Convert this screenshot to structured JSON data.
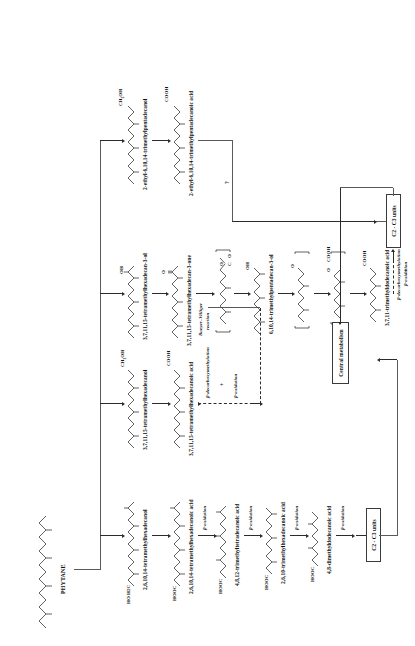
{
  "figure": {
    "title": "PHYTANE",
    "type": "biochemical-degradation-pathway"
  },
  "nodes": {
    "phytane": {
      "name": "PHYTANE"
    },
    "branch_mono_terminal": {
      "col_header_left": "HO H2C",
      "compounds": [
        {
          "atom": "HO H2C",
          "name": "2,6,10,14-tetramethylhexadecanol"
        },
        {
          "atom": "HOOC",
          "name": "2,6,10,14-tetramethylhexadecanoic acid"
        },
        {
          "atom": "HOOC",
          "name": "4,8,12-trimethyltetradecanoic acid"
        },
        {
          "atom": "HOOC",
          "name": "2,6,10-trimethylhexadecanoic acid"
        },
        {
          "atom": "HOOC",
          "name": "4,8-dimethyldodecanoic acid"
        }
      ],
      "step_labels": [
        "β-oxidation",
        "β-oxidation",
        "β-oxidation",
        "β-oxidation"
      ]
    },
    "branch_omega": {
      "compounds": [
        {
          "atom": "CH2OH",
          "name": "3,7,11,15-tetramethylhexadecanol"
        },
        {
          "atom": "COOH",
          "name": "3,7,11,15-tetramethylhexadecanoic acid"
        }
      ],
      "step_label_1": "β-decarboxymethylation",
      "step_plus": "+",
      "step_label_2": "β-oxidation"
    },
    "branch_subterminal": {
      "compounds": [
        {
          "atom": "OH",
          "name": "3,7,11,15-tetramethylhexadecan-3-ol"
        },
        {
          "atom": "O",
          "name": "3,7,11,15-tetramethylhexadecan-3-one"
        },
        {
          "atom": "O C O",
          "name": ""
        },
        {
          "atom": "OH",
          "name": "6,10,14-trimethylpentadecan-3-ol"
        },
        {
          "atom": "O",
          "name": ""
        },
        {
          "atom": "O COOH",
          "name": ""
        },
        {
          "atom": "COOH",
          "name": "3,7,11-trimethyldodecanoic acid"
        }
      ],
      "reaction_label": "Baeyer–Villiger\nreaction",
      "step_label_1": "β-decarboxymethylation",
      "step_plus": "+",
      "step_label_2": "β-oxidation"
    },
    "branch_ethyl": {
      "compounds": [
        {
          "atom": "CH2OH",
          "name": "2-ethyl-6,10,14-trimethylpentadecanol"
        },
        {
          "atom": "COOH",
          "name": "2-ethyl-6,10,14-trimethylpentadecanoic acid"
        }
      ],
      "unknown_step": "?"
    }
  },
  "boxes": {
    "c2c3_lower": "C2 - C3 units",
    "c2c3_upper": "C2 - C3 units",
    "central_metabolism": "Central metabolism"
  }
}
